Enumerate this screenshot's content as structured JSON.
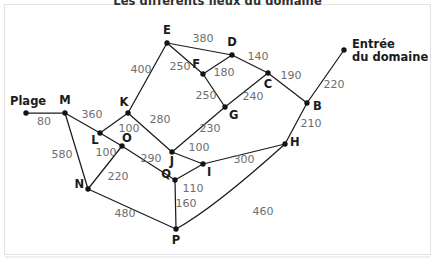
{
  "figure": {
    "title": "Les différents lieux du domaine",
    "background_color": "#ffffff",
    "panel_border_color": "#e3e3e3",
    "edge_color": "#1c1c1c",
    "node_color": "#141414",
    "weight_color": "#6e6e6e",
    "label_color": "#1b1b1b"
  },
  "chart_data": {
    "type": "diagram",
    "title": "Les différents lieux du domaine",
    "xlabel": "",
    "ylabel": "",
    "grid": false,
    "legend": "none",
    "nodes": [
      {
        "id": "Plage",
        "label": "Plage",
        "x": 26,
        "y": 113,
        "label_x": 26,
        "label_y": 104,
        "label_anchor": "middle",
        "terminal": true
      },
      {
        "id": "M",
        "label": "M",
        "x": 65,
        "y": 113,
        "label_x": 65,
        "label_y": 104,
        "label_anchor": "middle",
        "terminal": false
      },
      {
        "id": "E",
        "label": "E",
        "x": 167,
        "y": 43,
        "label_x": 167,
        "label_y": 34,
        "label_anchor": "middle",
        "terminal": false
      },
      {
        "id": "D",
        "label": "D",
        "x": 232,
        "y": 55,
        "label_x": 232,
        "label_y": 46,
        "label_anchor": "middle",
        "terminal": false
      },
      {
        "id": "F",
        "label": "F",
        "x": 203,
        "y": 74,
        "label_x": 200,
        "label_y": 68,
        "label_anchor": "end",
        "terminal": false
      },
      {
        "id": "C",
        "label": "C",
        "x": 268,
        "y": 73,
        "label_x": 268,
        "label_y": 88,
        "label_anchor": "middle",
        "terminal": false
      },
      {
        "id": "B",
        "label": "B",
        "x": 307,
        "y": 103,
        "label_x": 313,
        "label_y": 110,
        "label_anchor": "start",
        "terminal": false
      },
      {
        "id": "Entree",
        "label": "Entrée",
        "x": 344,
        "y": 50,
        "label_x": 352,
        "label_y": 49,
        "label_anchor": "start",
        "terminal": true
      },
      {
        "id": "G",
        "label": "G",
        "x": 225,
        "y": 107,
        "label_x": 229,
        "label_y": 119,
        "label_anchor": "start",
        "terminal": false
      },
      {
        "id": "K",
        "label": "K",
        "x": 128,
        "y": 113,
        "label_x": 124,
        "label_y": 106,
        "label_anchor": "middle",
        "terminal": false
      },
      {
        "id": "L",
        "label": "L",
        "x": 100,
        "y": 133,
        "label_x": 95,
        "label_y": 144,
        "label_anchor": "middle",
        "terminal": false
      },
      {
        "id": "O",
        "label": "O",
        "x": 122,
        "y": 146,
        "label_x": 122,
        "label_y": 142,
        "label_anchor": "start",
        "terminal": false
      },
      {
        "id": "J",
        "label": "J",
        "x": 172,
        "y": 152,
        "label_x": 172,
        "label_y": 165,
        "label_anchor": "middle",
        "terminal": false
      },
      {
        "id": "I",
        "label": "I",
        "x": 203,
        "y": 164,
        "label_x": 207,
        "label_y": 176,
        "label_anchor": "start",
        "terminal": false
      },
      {
        "id": "Q",
        "label": "Q",
        "x": 175,
        "y": 180,
        "label_x": 171,
        "label_y": 178,
        "label_anchor": "end",
        "terminal": false
      },
      {
        "id": "N",
        "label": "N",
        "x": 88,
        "y": 189,
        "label_x": 84,
        "label_y": 188,
        "label_anchor": "end",
        "terminal": false
      },
      {
        "id": "H",
        "label": "H",
        "x": 285,
        "y": 144,
        "label_x": 290,
        "label_y": 146,
        "label_anchor": "start",
        "terminal": false
      },
      {
        "id": "P",
        "label": "P",
        "x": 176,
        "y": 229,
        "label_x": 176,
        "label_y": 244,
        "label_anchor": "middle",
        "terminal": false
      }
    ],
    "place_labels": [
      {
        "id": "plage-label",
        "lines": [
          "Plage"
        ],
        "x": 10,
        "y": 105,
        "anchor": "start"
      },
      {
        "id": "entree-label",
        "lines": [
          "Entrée",
          "du domaine"
        ],
        "x": 352,
        "y": 48,
        "anchor": "start"
      }
    ],
    "edges": [
      {
        "from": "Plage",
        "to": "M",
        "weight": 80,
        "label_x": 44,
        "label_y": 125,
        "curved": false
      },
      {
        "from": "M",
        "to": "L",
        "weight": 360,
        "label_x": 92,
        "label_y": 118,
        "curved": false
      },
      {
        "from": "M",
        "to": "N",
        "weight": 580,
        "label_x": 62,
        "label_y": 158,
        "curved": false
      },
      {
        "from": "E",
        "to": "K",
        "weight": 400,
        "label_x": 141,
        "label_y": 73,
        "curved": false
      },
      {
        "from": "E",
        "to": "D",
        "weight": 380,
        "label_x": 203,
        "label_y": 42,
        "curved": false
      },
      {
        "from": "E",
        "to": "F",
        "weight": 250,
        "label_x": 180,
        "label_y": 70,
        "curved": false
      },
      {
        "from": "D",
        "to": "F",
        "weight": 180,
        "label_x": 224,
        "label_y": 76,
        "curved": false
      },
      {
        "from": "D",
        "to": "C",
        "weight": 140,
        "label_x": 258,
        "label_y": 60,
        "curved": false
      },
      {
        "from": "F",
        "to": "G",
        "weight": 250,
        "label_x": 206,
        "label_y": 99,
        "curved": false
      },
      {
        "from": "C",
        "to": "G",
        "weight": 240,
        "label_x": 253,
        "label_y": 100,
        "curved": false
      },
      {
        "from": "C",
        "to": "B",
        "weight": 190,
        "label_x": 291,
        "label_y": 79,
        "curved": false
      },
      {
        "from": "B",
        "to": "Entree",
        "weight": 220,
        "label_x": 334,
        "label_y": 88,
        "curved": false
      },
      {
        "from": "B",
        "to": "H",
        "weight": 210,
        "label_x": 311,
        "label_y": 127,
        "curved": false
      },
      {
        "from": "K",
        "to": "L",
        "weight": 100,
        "label_x": 129,
        "label_y": 132,
        "curved": false
      },
      {
        "from": "K",
        "to": "J",
        "weight": 280,
        "label_x": 160,
        "label_y": 123,
        "curved": false
      },
      {
        "from": "L",
        "to": "O",
        "weight": 100,
        "label_x": 106,
        "label_y": 156,
        "curved": false
      },
      {
        "from": "O",
        "to": "N",
        "weight": 220,
        "label_x": 118,
        "label_y": 180,
        "curved": false
      },
      {
        "from": "O",
        "to": "Q",
        "weight": 290,
        "label_x": 151,
        "label_y": 162,
        "curved": false
      },
      {
        "from": "G",
        "to": "J",
        "weight": 230,
        "label_x": 210,
        "label_y": 132,
        "curved": false
      },
      {
        "from": "J",
        "to": "I",
        "weight": 100,
        "label_x": 199,
        "label_y": 151,
        "curved": false
      },
      {
        "from": "I",
        "to": "H",
        "weight": 300,
        "label_x": 244,
        "label_y": 163,
        "curved": false
      },
      {
        "from": "I",
        "to": "Q",
        "weight": 110,
        "label_x": 193,
        "label_y": 192,
        "curved": false
      },
      {
        "from": "Q",
        "to": "P",
        "weight": 160,
        "label_x": 186,
        "label_y": 207,
        "curved": false
      },
      {
        "from": "N",
        "to": "P",
        "weight": 480,
        "label_x": 125,
        "label_y": 217,
        "curved": false
      },
      {
        "from": "H",
        "to": "P",
        "weight": 460,
        "label_x": 263,
        "label_y": 215,
        "curved": true,
        "curve_cx": 214,
        "curve_cy": 208
      }
    ]
  }
}
